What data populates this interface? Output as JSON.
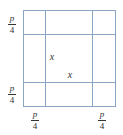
{
  "diagram": {
    "type": "square-grid-corner-cut",
    "line_color": "#8aa4c4",
    "outer_square": {
      "x": 23,
      "y": 10,
      "width": 92,
      "height": 96
    },
    "vertical_lines": [
      45,
      92
    ],
    "horizontal_lines": [
      34,
      82
    ],
    "labels": {
      "left_top": {
        "numerator": "p",
        "denominator": "4"
      },
      "left_bottom": {
        "numerator": "p",
        "denominator": "4"
      },
      "bottom_left": {
        "numerator": "p",
        "denominator": "4"
      },
      "bottom_right": {
        "numerator": "p",
        "denominator": "4"
      },
      "inner_vertical_x": "x",
      "inner_horizontal_x": "x"
    }
  }
}
